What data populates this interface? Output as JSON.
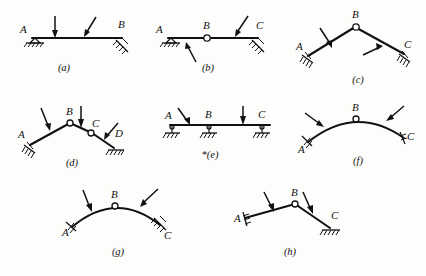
{
  "figure": {
    "background_color": "#fdfdfc",
    "ink_color": "#111111"
  },
  "diagrams": [
    {
      "id": "a",
      "caption": "(a)",
      "type": "straight-beam",
      "description": "Horizontal straight beam with pin support at A and inclined hatched support at B, two inclined downward point loads",
      "joints": [
        {
          "label": "A",
          "kind": "support-pin-hatched"
        },
        {
          "label": "B",
          "kind": "support-inclined-hatched"
        }
      ],
      "hinges": [],
      "loads": 2
    },
    {
      "id": "b",
      "caption": "(b)",
      "type": "straight-beam-hinged",
      "description": "Horizontal beam with pin support at A, internal hinge at B, inclined hatched support at C, one upward load from below and one downward inclined load",
      "joints": [
        {
          "label": "A",
          "kind": "support-pin-hatched"
        },
        {
          "label": "B",
          "kind": "internal-hinge"
        },
        {
          "label": "C",
          "kind": "support-inclined-hatched"
        }
      ],
      "hinges": [
        "B"
      ],
      "loads": 2
    },
    {
      "id": "c",
      "caption": "(c)",
      "type": "three-hinged-frame",
      "description": "Two inclined straight members meeting at apex hinge B, inclined hatched supports at A and C, one downward load and one upward load",
      "joints": [
        {
          "label": "A",
          "kind": "support-inclined-hatched"
        },
        {
          "label": "B",
          "kind": "internal-hinge"
        },
        {
          "label": "C",
          "kind": "support-inclined-hatched"
        }
      ],
      "hinges": [
        "B"
      ],
      "loads": 2
    },
    {
      "id": "d",
      "caption": "(d)",
      "type": "multi-hinged-frame",
      "description": "Chain of straight members with internal hinges at B and C, inclined hatched support at A and hatched support at D, three inclined loads",
      "joints": [
        {
          "label": "A",
          "kind": "support-inclined-hatched"
        },
        {
          "label": "B",
          "kind": "internal-hinge"
        },
        {
          "label": "C",
          "kind": "internal-hinge"
        },
        {
          "label": "D",
          "kind": "support-inclined-hatched"
        }
      ],
      "hinges": [
        "B",
        "C"
      ],
      "loads": 3
    },
    {
      "id": "e",
      "caption": "*(e)",
      "type": "continuous-beam",
      "description": "Continuous horizontal beam on three pin/roller supports at A, B and C with hatched ground, two inclined downward loads",
      "joints": [
        {
          "label": "A",
          "kind": "support-pin-on-ground"
        },
        {
          "label": "B",
          "kind": "support-pin-on-ground"
        },
        {
          "label": "C",
          "kind": "support-pin-on-ground"
        }
      ],
      "hinges": [],
      "loads": 2,
      "starred": true
    },
    {
      "id": "f",
      "caption": "(f)",
      "type": "three-hinged-arch",
      "description": "Curved arch with crown hinge at B, inclined hatched supports at A and C, two inward inclined loads",
      "joints": [
        {
          "label": "A",
          "kind": "support-inclined-hatched"
        },
        {
          "label": "B",
          "kind": "internal-hinge"
        },
        {
          "label": "C",
          "kind": "support-inclined-hatched"
        }
      ],
      "hinges": [
        "B"
      ],
      "loads": 2
    },
    {
      "id": "g",
      "caption": "(g)",
      "type": "three-hinged-arch",
      "description": "Curved arch with crown hinge at B, inclined hatched support at A and inclined hatched support at C, two inclined downward loads",
      "joints": [
        {
          "label": "A",
          "kind": "support-inclined-hatched"
        },
        {
          "label": "B",
          "kind": "internal-hinge"
        },
        {
          "label": "C",
          "kind": "support-inclined-hatched"
        }
      ],
      "hinges": [
        "B"
      ],
      "loads": 2
    },
    {
      "id": "h",
      "caption": "(h)",
      "type": "three-hinged-frame",
      "description": "Two inclined straight members meeting at apex hinge B, inclined hatched support at A and horizontal hatched support at C, two downward inclined loads",
      "joints": [
        {
          "label": "A",
          "kind": "support-inclined-hatched"
        },
        {
          "label": "B",
          "kind": "internal-hinge"
        },
        {
          "label": "C",
          "kind": "support-hatched-ground"
        }
      ],
      "hinges": [
        "B"
      ],
      "loads": 2
    }
  ],
  "labels": {
    "A": "A",
    "B": "B",
    "C": "C",
    "D": "D"
  }
}
